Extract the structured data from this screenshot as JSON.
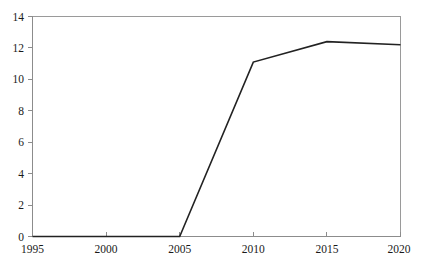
{
  "chart_data": {
    "type": "line",
    "title": "",
    "xlabel": "",
    "ylabel": "",
    "xlim": [
      1995,
      2020
    ],
    "ylim": [
      0,
      14
    ],
    "grid": false,
    "legend": null,
    "x": [
      1995,
      2000,
      2005,
      2010,
      2015,
      2020
    ],
    "series": [
      {
        "name": "",
        "values": [
          0,
          0,
          0,
          11.1,
          12.4,
          12.2
        ],
        "color": "#222222"
      }
    ],
    "x_ticks": [
      1995,
      2000,
      2005,
      2010,
      2015,
      2020
    ],
    "x_tick_labels": [
      "1995",
      "2000",
      "2005",
      "2010",
      "2015",
      "2020"
    ],
    "y_ticks": [
      0,
      2,
      4,
      6,
      8,
      10,
      12,
      14
    ],
    "y_tick_labels": [
      "0",
      "2",
      "4",
      "6",
      "8",
      "10",
      "12",
      "14"
    ],
    "frame_color": "#9a9a9a",
    "axis_color": "#8c8c8c",
    "background": "#ffffff"
  }
}
